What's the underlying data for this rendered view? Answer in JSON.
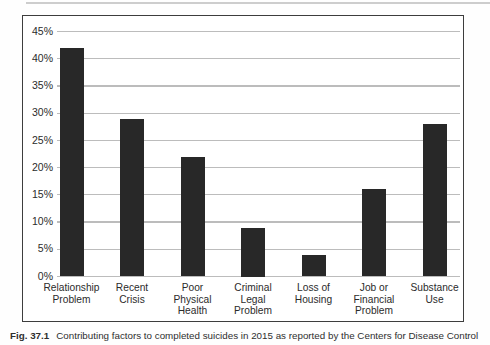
{
  "caption": {
    "label": "Fig. 37.1",
    "text": "Contributing factors to completed suicides in 2015 as reported by the Centers for Disease Control"
  },
  "chart_data": {
    "type": "bar",
    "title": "",
    "xlabel": "",
    "ylabel": "",
    "categories": [
      "Relationship Problem",
      "Recent Crisis",
      "Poor Physical Health",
      "Criminal Legal Problem",
      "Loss of Housing",
      "Job or Financial Problem",
      "Substance Use"
    ],
    "category_lines": [
      [
        "Relationship",
        "Problem"
      ],
      [
        "Recent",
        "Crisis"
      ],
      [
        "Poor",
        "Physical",
        "Health"
      ],
      [
        "Criminal",
        "Legal",
        "Problem"
      ],
      [
        "Loss of",
        "Housing"
      ],
      [
        "Job or",
        "Financial",
        "Problem"
      ],
      [
        "Substance",
        "Use"
      ]
    ],
    "values": [
      42,
      29,
      22,
      9,
      4,
      16,
      28
    ],
    "unit": "%",
    "ylim": [
      0,
      45
    ],
    "ytick_step": 5,
    "ytick_labels": [
      "0%",
      "5%",
      "10%",
      "15%",
      "20%",
      "25%",
      "30%",
      "35%",
      "40%",
      "45%"
    ],
    "grid": true,
    "legend": "none",
    "bar_color": "#282828",
    "gridline_color": "#bcbcbc",
    "border_color": "#3d3d3d"
  }
}
